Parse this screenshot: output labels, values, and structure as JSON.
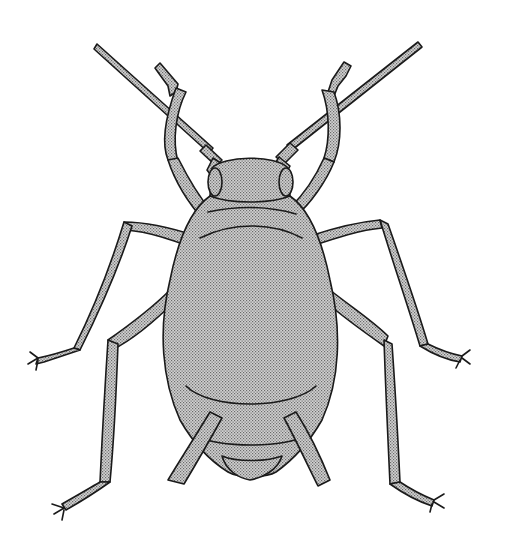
{
  "image": {
    "subject": "aphid illustration",
    "style": "black ink line drawing with stippled gray fill",
    "colors": {
      "background": "#ffffff",
      "outline": "#1a1a1a",
      "fill": "#bdbdbd"
    }
  }
}
